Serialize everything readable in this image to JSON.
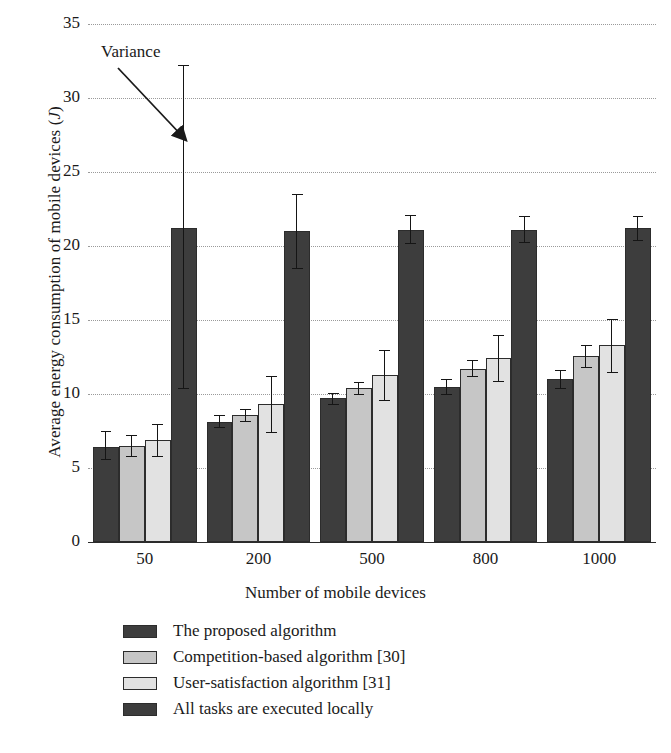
{
  "chart_data": {
    "type": "bar",
    "title": "",
    "xlabel": "Number of mobile devices",
    "ylabel": "Average energy consumption of mobile devices (J)",
    "ylabel_unit_italic": "J",
    "categories": [
      "50",
      "200",
      "500",
      "800",
      "1000"
    ],
    "ylim": [
      0,
      35
    ],
    "yticks": [
      0,
      5,
      10,
      15,
      20,
      25,
      30,
      35
    ],
    "grid": "dotted-horizontal",
    "legend_position": "below-plot",
    "annotations": [
      {
        "text": "Variance",
        "points_to": "error-bar-of-first-group-fourth-bar"
      }
    ],
    "series": [
      {
        "name": "The proposed algorithm",
        "color": "#3d3d3d",
        "values": [
          6.4,
          8.1,
          9.7,
          10.5,
          11.0
        ],
        "err_low": [
          5.6,
          7.8,
          9.3,
          10.0,
          10.4
        ],
        "err_high": [
          7.5,
          8.6,
          10.1,
          11.0,
          11.6
        ]
      },
      {
        "name": "Competition-based algorithm [30]",
        "color": "#c6c6c6",
        "values": [
          6.5,
          8.6,
          10.4,
          11.7,
          12.6
        ],
        "err_low": [
          5.8,
          8.2,
          10.0,
          11.2,
          11.8
        ],
        "err_high": [
          7.2,
          9.0,
          10.8,
          12.3,
          13.3
        ]
      },
      {
        "name": "User-satisfaction algorithm [31]",
        "color": "#e2e2e2",
        "values": [
          6.9,
          9.3,
          11.3,
          12.4,
          13.3
        ],
        "err_low": [
          5.8,
          7.4,
          9.6,
          10.9,
          11.5
        ],
        "err_high": [
          8.0,
          11.2,
          13.0,
          14.0,
          15.1
        ]
      },
      {
        "name": "All tasks are executed locally",
        "color": "#3d3d3d",
        "values": [
          21.2,
          21.0,
          21.1,
          21.1,
          21.2
        ],
        "err_low": [
          10.4,
          18.5,
          20.2,
          20.3,
          20.4
        ],
        "err_high": [
          32.2,
          23.5,
          22.1,
          22.0,
          22.0
        ]
      }
    ]
  },
  "legend": {
    "items": [
      {
        "label": "The proposed algorithm",
        "color": "#3d3d3d"
      },
      {
        "label": "Competition-based algorithm [30]",
        "color": "#c6c6c6"
      },
      {
        "label": "User-satisfaction algorithm [31]",
        "color": "#e2e2e2"
      },
      {
        "label": "All tasks are executed locally",
        "color": "#3d3d3d"
      }
    ]
  },
  "axes": {
    "y_title_prefix": "Average energy consumption of mobile devices (",
    "y_title_italic": "J",
    "y_title_suffix": ")",
    "x_title": "Number of mobile devices"
  },
  "annotation": {
    "variance_label": "Variance"
  }
}
